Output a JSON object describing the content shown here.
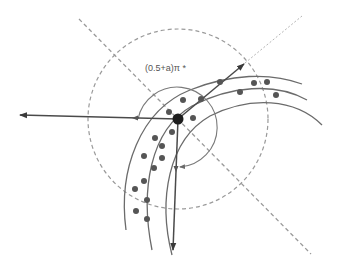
{
  "diagram": {
    "angle_label": "(0.5+a)π *",
    "colors": {
      "background": "#ffffff",
      "arc": "#6b6b6b",
      "dashed": "#9a9a9a",
      "dotted": "#b5b5b5",
      "arrow": "#4a4a4a",
      "dot": "#555555",
      "center_dot": "#222222"
    },
    "center_point": {
      "x": 178,
      "y": 119,
      "r": 6
    },
    "outer_dashed_circle": {
      "cx": 178,
      "cy": 119,
      "r": 90
    },
    "inner_circle_arc": {
      "cx": 178,
      "cy": 127,
      "r": 40
    },
    "arrows": [
      {
        "name": "left-arrow",
        "x1": 178,
        "y1": 119,
        "x2": 18,
        "y2": 115
      },
      {
        "name": "upper-right-arrow",
        "x1": 178,
        "y1": 119,
        "x2": 245,
        "y2": 63
      },
      {
        "name": "down-arrow",
        "x1": 178,
        "y1": 119,
        "x2": 173,
        "y2": 252
      }
    ],
    "dots": [
      [
        220,
        82
      ],
      [
        201,
        99
      ],
      [
        183,
        100
      ],
      [
        169,
        112
      ],
      [
        193,
        118
      ],
      [
        172,
        132
      ],
      [
        155,
        138
      ],
      [
        162,
        146
      ],
      [
        144,
        156
      ],
      [
        162,
        158
      ],
      [
        154,
        168
      ],
      [
        144,
        181
      ],
      [
        135,
        189
      ],
      [
        147,
        200
      ],
      [
        136,
        211
      ],
      [
        147,
        219
      ],
      [
        254,
        83
      ],
      [
        267,
        82
      ],
      [
        240,
        92
      ],
      [
        276,
        95
      ]
    ]
  }
}
